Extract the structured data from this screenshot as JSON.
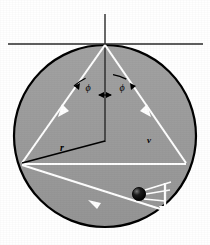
{
  "figure": {
    "canvas": {
      "width": 210,
      "height": 245,
      "background": "#ffffff"
    },
    "colors": {
      "disk_fill": "#9b9b9b",
      "disk_stroke": "#000000",
      "ray": "#ffffff",
      "axis": "#1a1a1a",
      "radius_line": "#000000",
      "ball": "#000000",
      "label": "#000000"
    },
    "disk": {
      "name": "shaded-circle",
      "center_x": 105,
      "center_y": 136,
      "radius": 91,
      "stroke_width": 2.2
    },
    "axes": {
      "horizontal": {
        "x1": 8,
        "y1": 44,
        "x2": 203,
        "y2": 44
      },
      "vertical": {
        "x1": 105,
        "y1": 14,
        "x2": 105,
        "y2": 142
      }
    },
    "vertices": {
      "top": {
        "x": 105,
        "y": 44
      },
      "left": {
        "x": 22,
        "y": 163
      },
      "right": {
        "x": 186,
        "y": 163
      }
    },
    "rays": [
      {
        "name": "ray-top-to-left",
        "from": "top",
        "to": "left",
        "arrow_at": 0.52,
        "arrow_dir": "down-left"
      },
      {
        "name": "ray-top-to-right",
        "from": "top",
        "to": "right",
        "arrow_at": 0.52,
        "arrow_dir": "down-right"
      },
      {
        "name": "ray-right-to-left",
        "from": "right",
        "to": "left",
        "arrow_at": 0.58,
        "arrow_dir": "left"
      }
    ],
    "angle_labels": [
      {
        "name": "angle-phi-left",
        "text": "ϕ",
        "x": 88,
        "y": 88
      },
      {
        "name": "angle-phi-right",
        "text": "ϕ",
        "x": 122,
        "y": 88
      }
    ],
    "angle_arc": {
      "name": "phi-angle-arc",
      "description": "double-headed arc spanning both phi angles at top vertex",
      "radius": 46
    },
    "radius_label": {
      "name": "radius-label-r",
      "text": "r",
      "x": 62,
      "y": 148
    },
    "radius_line": {
      "name": "radius-segment",
      "x1": 22,
      "y1": 163,
      "x2": 105,
      "y2": 141
    },
    "secondary_label": {
      "name": "velocity-label",
      "text": "v",
      "x": 149,
      "y": 140
    },
    "ball": {
      "name": "falling-ball",
      "cx": 139,
      "cy": 194,
      "r": 6.5,
      "highlight": true
    },
    "motion_lines": {
      "name": "ball-motion-trail",
      "count": 3,
      "origin_x": 146,
      "origin_y": 192
    },
    "down_arrow": {
      "name": "downward-velocity-arrow",
      "x": 165,
      "y_start": 183,
      "y_end": 221,
      "color": "#ffffff"
    }
  }
}
